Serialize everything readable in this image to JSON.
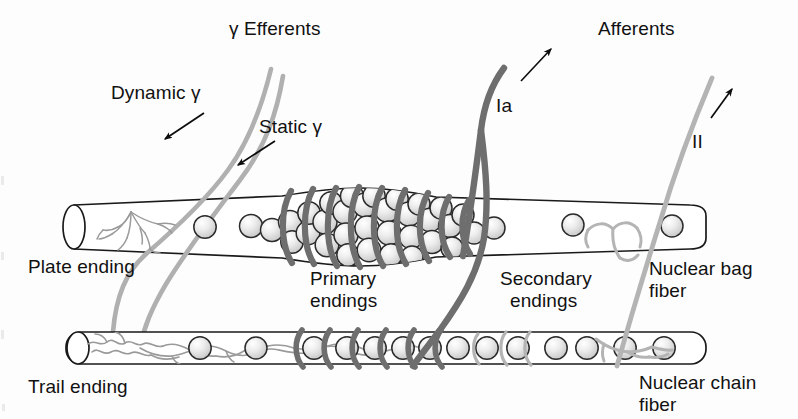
{
  "figure": {
    "background_color": "#fdfdfd",
    "text_color": "#111111"
  },
  "colors": {
    "outline": "#1a1a1a",
    "afferent_ia": "#6e6e6e",
    "afferent_ii": "#b4b4b4",
    "gamma_efferent": "#b0b0b0",
    "nucleus_fill": "#e2e2e2",
    "nucleus_edge": "#2b2b2b",
    "fiber_fill": "#ffffff",
    "trail_ending": "#9a9a9a",
    "plate_ending": "#9a9a9a",
    "spiral_wrap": "#6e6e6e"
  },
  "headers": {
    "efferents": "γ Efferents",
    "afferents": "Afferents"
  },
  "labels": {
    "dynamic_gamma": "Dynamic γ",
    "static_gamma": "Static γ",
    "ia": "Ia",
    "ii": "II",
    "plate_ending": "Plate ending",
    "trail_ending": "Trail ending",
    "primary_endings_line1": "Primary",
    "primary_endings_line2": "endings",
    "secondary_endings_line1": "Secondary",
    "secondary_endings_line2": "endings",
    "nuclear_bag_line1": "Nuclear bag",
    "nuclear_bag_line2": "fiber",
    "nuclear_chain_line1": "Nuclear chain",
    "nuclear_chain_line2": "fiber"
  },
  "structures": {
    "nuclear_bag_fiber": {
      "name": "Nuclear bag fiber",
      "nuclei_count_equatorial": 34,
      "nuclei_count_polar": 8
    },
    "nuclear_chain_fiber": {
      "name": "Nuclear chain fiber",
      "nuclei_count": 17
    },
    "primary_endings": {
      "name": "Primary (annulospiral) endings",
      "wrap_count_bag": 9,
      "wrap_count_chain": 7
    },
    "secondary_endings": {
      "name": "Secondary (flower-spray) endings",
      "wrap_count": 5
    }
  }
}
